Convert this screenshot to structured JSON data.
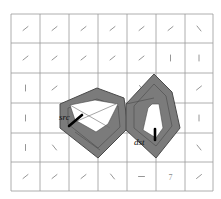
{
  "figure": {
    "type": "grid-world path planning diagram",
    "grid": {
      "cols": 7,
      "rows": 6,
      "x_lines": [
        11,
        40,
        69,
        98,
        127,
        156,
        185,
        213
      ],
      "y_lines": [
        14,
        43,
        73,
        103,
        133,
        162,
        191
      ],
      "line_color": "#9a9a9a"
    },
    "cell_glyphs": [
      [
        "/",
        "/",
        "/",
        "/",
        "/",
        "/",
        "\\"
      ],
      [
        "/",
        "/",
        "/",
        "/",
        "/",
        "|",
        "|"
      ],
      [
        "|",
        "/",
        "",
        "",
        "\\",
        "",
        "/"
      ],
      [
        "|",
        "",
        "",
        "",
        "|",
        "",
        "|"
      ],
      [
        "|",
        "\\",
        "",
        "",
        "",
        "",
        "\\"
      ],
      [
        "/",
        "/",
        "/",
        "\\",
        "-",
        "7",
        "/"
      ]
    ],
    "labels": {
      "src": "src",
      "dst": "dst"
    },
    "colors": {
      "region_fill": "#7b7b7b",
      "region_edge": "#4a4a4a",
      "hole_fill": "#ffffff",
      "arrow": "#000000"
    }
  }
}
